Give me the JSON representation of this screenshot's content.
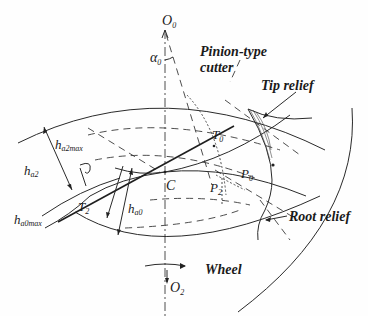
{
  "diagram": {
    "type": "gear-meshing-schematic",
    "labels": {
      "cutter_center": "O",
      "cutter_center_sub": "0",
      "wheel_center": "O",
      "wheel_center_sub": "2",
      "pressure_angle": "α",
      "pressure_angle_sub": "0",
      "pinion_type_line1": "Pinion-type",
      "pinion_type_line2": "cutter",
      "tip_relief": "Tip relief",
      "root_relief": "Root relief",
      "wheel": "Wheel",
      "pitch_point": "C",
      "t0": "T",
      "t0_sub": "0",
      "t2": "T",
      "t2_sub": "2",
      "p0": "P",
      "p0_sub": "0",
      "p2": "P",
      "p2_sub": "2",
      "ha2max": "h",
      "ha2max_sub": "a2max",
      "ha2": "h",
      "ha2_sub": "a2",
      "ha0": "h",
      "ha0_sub": "a0",
      "ha0max": "h",
      "ha0max_sub": "a0max"
    },
    "colors": {
      "stroke": "#2a2a2a",
      "background": "#fefefe"
    }
  }
}
